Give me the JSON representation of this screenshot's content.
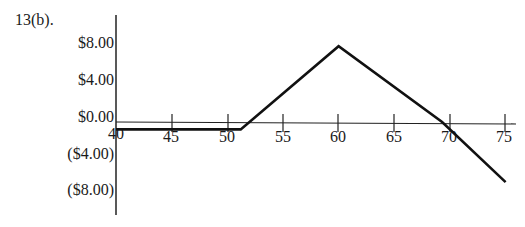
{
  "figure_label": "13(b).",
  "chart_data": {
    "type": "line",
    "title": "13(b).",
    "xlabel": "",
    "ylabel": "",
    "x_ticks": [
      40,
      45,
      50,
      55,
      60,
      65,
      70,
      75
    ],
    "x_tick_labels": [
      "40",
      "45",
      "50",
      "55",
      "60",
      "65",
      "70",
      "75"
    ],
    "y_ticks": [
      8,
      4,
      0,
      -4,
      -8
    ],
    "y_tick_labels": [
      "$8.00",
      "$4.00",
      "$0.00",
      "($4.00)",
      "($8.00)"
    ],
    "xlim": [
      40,
      76
    ],
    "ylim": [
      -10,
      10
    ],
    "grid": false,
    "legend": null,
    "series": [
      {
        "name": "Profit",
        "x": [
          40,
          51.2,
          60,
          69.3,
          75
        ],
        "y": [
          -0.8,
          -0.8,
          8.2,
          0,
          -6.5
        ]
      }
    ]
  }
}
